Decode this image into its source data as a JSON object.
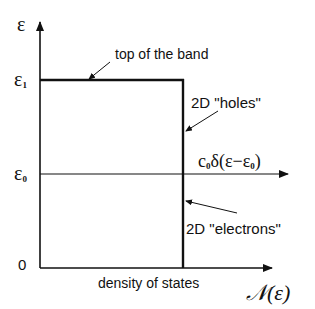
{
  "diagram": {
    "type": "density_of_states",
    "axes": {
      "y_label": "ε",
      "x_label": "𝒩(ε)",
      "x_caption": "density of states",
      "origin_label": "0"
    },
    "y_ticks": [
      {
        "label": "ε",
        "subscript": "1"
      },
      {
        "label": "ε",
        "subscript": "0"
      }
    ],
    "annotations": {
      "top_of_band": "top of the band",
      "holes": "2D \"holes\"",
      "electrons": "2D \"electrons\"",
      "delta_prefix": "c",
      "delta_prefix_sub": "0",
      "delta_body": "δ(ε−ε",
      "delta_sub": "0",
      "delta_close": ")"
    },
    "colors": {
      "line": "#111111",
      "background": "#ffffff"
    }
  }
}
